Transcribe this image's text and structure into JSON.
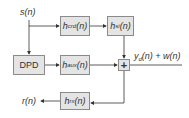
{
  "diagram": {
    "input_label": {
      "base": "s",
      "arg": "(n)"
    },
    "blocks": {
      "h_crd": {
        "base": "h",
        "sub": "crd",
        "arg": "(n)"
      },
      "h_si": {
        "base": "h",
        "sub": "si",
        "arg": "(n)"
      },
      "dpd": {
        "label": "DPD"
      },
      "h_aux": {
        "base": "h",
        "sub": "aux",
        "arg": "(n)"
      },
      "sum": {
        "symbol": "+"
      },
      "h_rx": {
        "base": "h",
        "sub": "rx",
        "arg": "(n)"
      }
    },
    "output_label": {
      "y_base": "y",
      "y_sub": "d",
      "rest": "(n) + w(n)"
    },
    "feedback_label": {
      "base": "r",
      "arg": "(n)"
    },
    "colors": {
      "box_fill": "#e4e4e4",
      "box_border": "#8a8a8a",
      "line": "#333333"
    }
  }
}
